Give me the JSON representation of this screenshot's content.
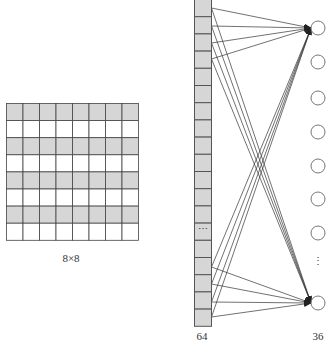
{
  "diagram": {
    "grid": {
      "rows": 8,
      "cols": 8,
      "label": "8×8",
      "shaded_rows": [
        0,
        2,
        4,
        6
      ],
      "fill_shaded": "#d6d6d6",
      "fill_plain": "#ffffff",
      "stroke": "#444444"
    },
    "input_vector": {
      "visible_cells": 19,
      "ellipsis_cell_index": 13,
      "ellipsis": "⋯",
      "label": "64",
      "fill": "#d6d6d6",
      "stroke": "#555555"
    },
    "output_nodes": {
      "visible_nodes": 8,
      "ellipsis": "⋮",
      "label": "36",
      "stroke": "#777777"
    },
    "connections": {
      "description": "Top 4 and bottom 4 input cells each connect with arrows to the first and last output nodes",
      "color": "#333333"
    }
  }
}
